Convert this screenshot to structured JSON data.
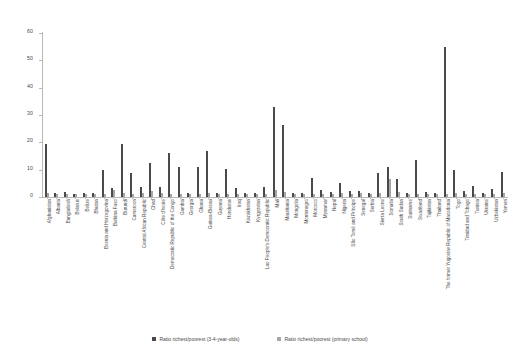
{
  "chart_data": {
    "type": "bar",
    "title": "",
    "subtitle": "",
    "xlabel": "",
    "ylabel": "",
    "ylim": [
      0,
      60
    ],
    "yticks": [
      0,
      10,
      20,
      30,
      40,
      50,
      60
    ],
    "grid": false,
    "legend_position": "bottom",
    "orientation": "vertical",
    "categories": [
      "Afghanistan",
      "Albania",
      "Bangladesh",
      "Belarus",
      "Belize",
      "Bhutan",
      "Bosnia and Herzegovina",
      "Burkina Faso",
      "Burundi",
      "Cameroon",
      "Central African Republic",
      "Chad",
      "Côte d'Ivoire",
      "Democratic Republic of the Congo",
      "Gambia",
      "Georgia",
      "Ghana",
      "Guinea-Bissau",
      "Guyana",
      "Honduras",
      "Iraq",
      "Kazakhstan",
      "Kyrgyzstan",
      "Lao People's Democratic Republic",
      "Mali",
      "Mauritania",
      "Mongolia",
      "Montenegro",
      "Morocco",
      "Myanmar",
      "Nepal",
      "Nigeria",
      "São Tomé and Príncipe",
      "Senegal",
      "Serbia",
      "Sierra Leone",
      "Somalia",
      "South Sudan",
      "Suriname",
      "Swaziland",
      "Tajikistan",
      "Thailand",
      "The former Yugoslav Republic of Macedonia",
      "Togo",
      "Trinidad and Tobago",
      "Tunisia",
      "Ukraine",
      "Uzbekistan",
      "Yemen"
    ],
    "series": [
      {
        "name": "Ratio richest/poorest (3-4-year-olds)",
        "color": "#4a4a4c",
        "values": [
          19.5,
          1.3,
          2.0,
          1.2,
          1.5,
          1.6,
          10.0,
          3.3,
          19.3,
          8.9,
          3.5,
          12.6,
          3.6,
          16.0,
          11.0,
          1.4,
          11.1,
          17.0,
          1.3,
          10.4,
          3.4,
          1.4,
          1.4,
          3.6,
          33.0,
          26.5,
          1.3,
          1.5,
          7.0,
          2.7,
          2.0,
          5.2,
          2.2,
          2.1,
          1.4,
          8.8,
          11.0,
          6.7,
          1.4,
          13.6,
          2.0,
          1.3,
          55.0,
          10.0,
          2.1,
          4.0,
          1.4,
          3.0,
          9.0
        ]
      },
      {
        "name": "Ratio richest/poorest (primary school)",
        "color": "#a6a6a6",
        "values": [
          1.6,
          1.0,
          1.1,
          1.0,
          1.0,
          1.1,
          1.0,
          2.6,
          1.4,
          1.2,
          1.4,
          2.2,
          1.3,
          1.1,
          1.1,
          1.0,
          1.1,
          1.3,
          1.0,
          1.1,
          1.2,
          1.0,
          1.0,
          1.2,
          2.7,
          2.0,
          1.0,
          1.0,
          1.1,
          1.1,
          1.1,
          1.4,
          1.1,
          1.3,
          1.0,
          1.6,
          6.5,
          2.0,
          1.0,
          1.1,
          1.0,
          1.0,
          1.1,
          1.5,
          1.0,
          1.1,
          1.0,
          1.0,
          1.4
        ]
      }
    ],
    "legend": [
      "Ratio richest/poorest (3-4-year-olds)",
      "Ratio richest/poorest (primary school)"
    ]
  }
}
